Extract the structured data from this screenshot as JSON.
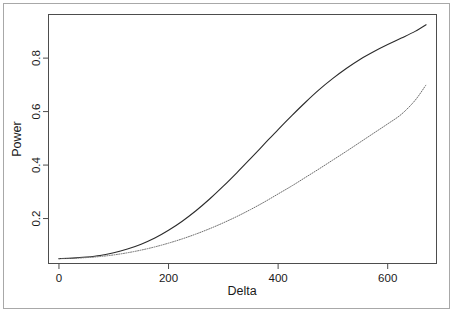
{
  "figure": {
    "background_color": "#ffffff",
    "outer_border_color": "#a8a8a8",
    "plot_frame_color": "#4d4d4d",
    "axis_text_color": "#1a1a1a"
  },
  "chart_data": {
    "type": "line",
    "title": "",
    "subtitle": "",
    "xlabel": "Delta",
    "ylabel": "Power",
    "xlim": [
      -20,
      690
    ],
    "ylim": [
      0.03,
      0.965
    ],
    "xticks": [
      0,
      200,
      400,
      600
    ],
    "xtick_labels": [
      "0",
      "200",
      "400",
      "600"
    ],
    "yticks": [
      0.2,
      0.4,
      0.6,
      0.8
    ],
    "ytick_labels": [
      "0.2",
      "0.4",
      "0.6",
      "0.8"
    ],
    "grid": false,
    "legend": false,
    "legend_position": "none",
    "annotations": [],
    "x": [
      0,
      25,
      50,
      75,
      100,
      125,
      150,
      175,
      200,
      225,
      250,
      275,
      300,
      325,
      350,
      375,
      400,
      425,
      450,
      475,
      500,
      525,
      550,
      575,
      600,
      625,
      650,
      670
    ],
    "series": [
      {
        "name": "solid-curve",
        "style": "solid",
        "color": "#2b2b2b",
        "width": 1.1,
        "values": [
          0.05,
          0.052,
          0.056,
          0.062,
          0.072,
          0.086,
          0.104,
          0.127,
          0.156,
          0.19,
          0.229,
          0.273,
          0.321,
          0.372,
          0.425,
          0.479,
          0.533,
          0.585,
          0.635,
          0.682,
          0.724,
          0.762,
          0.796,
          0.825,
          0.851,
          0.875,
          0.9,
          0.925
        ]
      },
      {
        "name": "dotted-curve",
        "style": "dotted",
        "color": "#6e6e6e",
        "width": 1.0,
        "values": [
          0.05,
          0.051,
          0.054,
          0.058,
          0.064,
          0.072,
          0.082,
          0.094,
          0.108,
          0.124,
          0.142,
          0.162,
          0.184,
          0.208,
          0.234,
          0.262,
          0.292,
          0.322,
          0.354,
          0.386,
          0.419,
          0.452,
          0.486,
          0.52,
          0.554,
          0.59,
          0.642,
          0.7
        ]
      }
    ]
  },
  "layout": {
    "outer_border": {
      "x": 3,
      "y": 3,
      "width": 447,
      "height": 306
    },
    "plot_frame": {
      "x": 48,
      "y": 14,
      "width": 389,
      "height": 250
    },
    "tick_length": 5
  }
}
